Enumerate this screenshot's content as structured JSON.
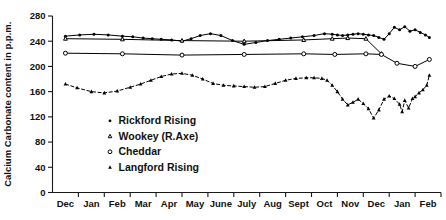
{
  "chart_data": {
    "type": "line",
    "title": "",
    "xlabel": "",
    "ylabel": "Calcium Carbonate content in p.p.m.",
    "ylim": [
      0,
      280
    ],
    "yticks": [
      0,
      40,
      80,
      120,
      160,
      200,
      240,
      280
    ],
    "ytick_labels": [
      "0",
      "40",
      "80",
      "120",
      "160",
      "200",
      "240",
      "280"
    ],
    "categories": [
      "Dec",
      "Jan",
      "Feb",
      "Mar",
      "Apr",
      "May",
      "June",
      "July",
      "Aug",
      "Sept",
      "Oct",
      "Nov",
      "Dec",
      "Jan",
      "Feb"
    ],
    "xtick_labels": [
      "Dec",
      "Jan",
      "Feb",
      "Mar",
      "Apr",
      "May",
      "June",
      "July",
      "Aug",
      "Sept",
      "Oct",
      "Nov",
      "Dec",
      "Jan",
      "Feb"
    ],
    "grid": false,
    "legend_position": "inside-lower-center",
    "series": [
      {
        "name": "Rickford Rising",
        "marker": "filled-circle",
        "linestyle": "solid",
        "x": [
          0.0,
          0.55,
          1.1,
          1.65,
          2.2,
          2.6,
          3.0,
          3.35,
          3.7,
          4.1,
          4.5,
          4.85,
          5.2,
          5.6,
          6.0,
          6.45,
          6.9,
          7.35,
          7.8,
          8.25,
          8.7,
          9.15,
          9.6,
          10.0,
          10.3,
          10.5,
          10.7,
          10.9,
          11.1,
          11.3,
          11.5,
          11.7,
          11.9,
          12.1,
          12.3,
          12.5,
          12.7,
          12.9,
          13.1,
          13.3,
          13.5,
          13.7,
          13.9,
          14.05
        ],
        "values": [
          248,
          250,
          251,
          250,
          248,
          247,
          245,
          244,
          243,
          242,
          240,
          244,
          249,
          252,
          249,
          241,
          235,
          238,
          241,
          243,
          245,
          247,
          249,
          252,
          251,
          250,
          249,
          250,
          251,
          252,
          251,
          250,
          249,
          246,
          243,
          252,
          262,
          258,
          263,
          256,
          258,
          254,
          250,
          246
        ]
      },
      {
        "name": "Wookey (R.Axe)",
        "marker": "open-triangle",
        "linestyle": "solid",
        "x": [
          0.0,
          2.2,
          4.5,
          6.9,
          9.2,
          10.3,
          10.9,
          11.6,
          12.2
        ],
        "values": [
          244,
          243,
          241,
          240,
          242,
          244,
          245,
          244,
          220
        ]
      },
      {
        "name": "Cheddar",
        "marker": "open-circle",
        "linestyle": "solid",
        "x": [
          0.0,
          2.2,
          4.5,
          6.9,
          9.2,
          10.4,
          11.6,
          12.2,
          12.8,
          13.5,
          14.05
        ],
        "values": [
          221,
          220,
          218,
          219,
          220,
          219,
          220,
          219,
          205,
          200,
          211
        ]
      },
      {
        "name": "Langford Rising",
        "marker": "filled-triangle",
        "linestyle": "dashed",
        "x": [
          0.0,
          0.45,
          1.0,
          1.5,
          2.0,
          2.5,
          2.9,
          3.3,
          3.7,
          4.1,
          4.5,
          4.9,
          5.3,
          5.7,
          6.1,
          6.5,
          6.9,
          7.3,
          7.7,
          8.1,
          8.5,
          8.9,
          9.3,
          9.6,
          9.9,
          10.1,
          10.3,
          10.5,
          10.7,
          10.9,
          11.1,
          11.3,
          11.5,
          11.7,
          11.9,
          12.1,
          12.3,
          12.5,
          12.7,
          12.9,
          13.0,
          13.1,
          13.25,
          13.4,
          13.5,
          13.65,
          13.8,
          13.95,
          14.05
        ],
        "values": [
          172,
          166,
          160,
          158,
          161,
          167,
          172,
          178,
          184,
          188,
          189,
          186,
          180,
          173,
          170,
          169,
          168,
          167,
          168,
          173,
          178,
          181,
          182,
          182,
          181,
          178,
          170,
          160,
          148,
          139,
          143,
          148,
          141,
          133,
          118,
          131,
          148,
          153,
          149,
          140,
          128,
          146,
          134,
          149,
          152,
          158,
          163,
          170,
          186
        ]
      }
    ],
    "legend": [
      {
        "label": "Rickford Rising",
        "marker": "filled-circle"
      },
      {
        "label": "Wookey (R.Axe)",
        "marker": "open-triangle"
      },
      {
        "label": "Cheddar",
        "marker": "open-circle"
      },
      {
        "label": "Langford Rising",
        "marker": "filled-triangle"
      }
    ],
    "colors": {
      "axis": "#1a1a1a",
      "series": "#000000",
      "background": "#ffffff"
    }
  }
}
